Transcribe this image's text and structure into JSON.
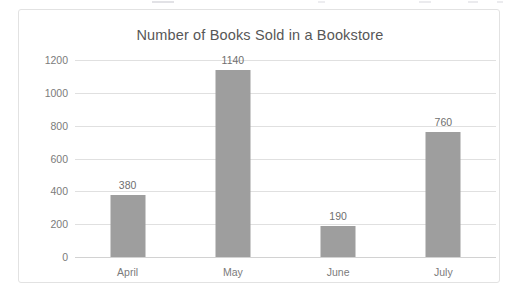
{
  "chart_data": {
    "type": "bar",
    "title": "Number of Books Sold in a Bookstore",
    "xlabel": "",
    "ylabel": "",
    "categories": [
      "April",
      "May",
      "June",
      "July"
    ],
    "values": [
      380,
      1140,
      190,
      760
    ],
    "data_labels": [
      "380",
      "1140",
      "190",
      "760"
    ],
    "ylim": [
      0,
      1200
    ],
    "ytick_labels": [
      "1200",
      "1000",
      "800",
      "600",
      "400",
      "200",
      "0"
    ],
    "ytick_values": [
      1200,
      1000,
      800,
      600,
      400,
      200,
      0
    ],
    "grid": true,
    "legend": false,
    "orientation": "vertical",
    "bar_color": "#9e9e9e",
    "text_color": "#7b7b7b",
    "title_color": "#575757",
    "gridline_color": "#e0e0e0",
    "background_color": "#ffffff",
    "border_color": "#e2e2e2"
  }
}
